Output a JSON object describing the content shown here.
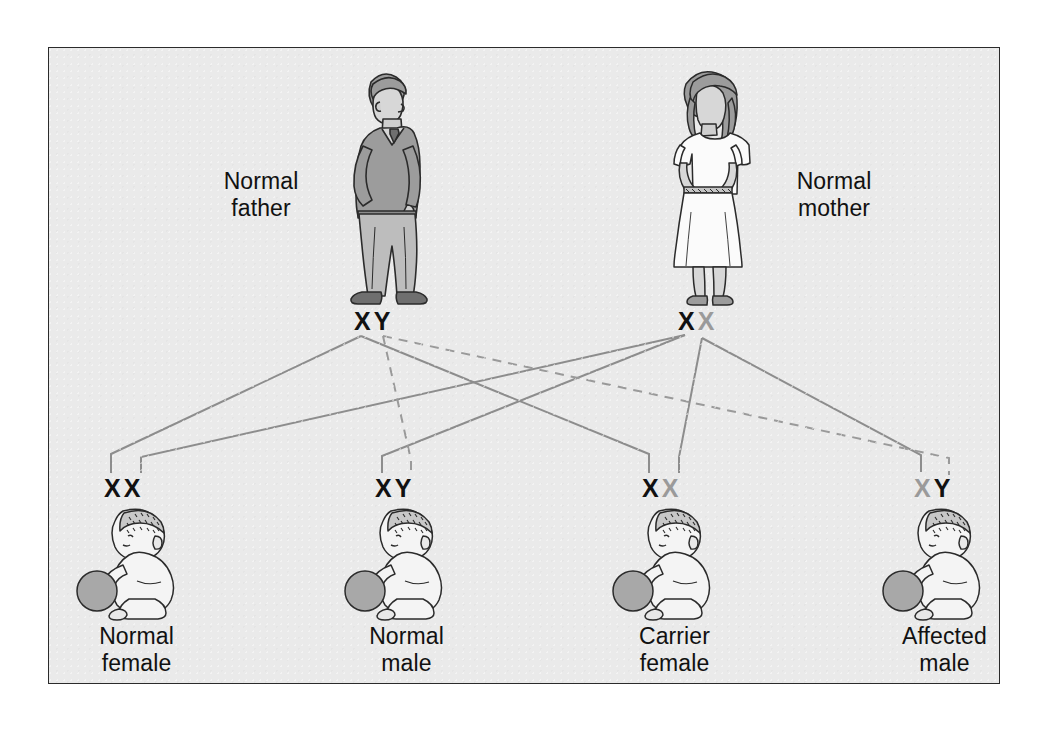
{
  "figure": {
    "type": "genetics-pedigree-punnett-diagram",
    "background_color": "#eaeaea",
    "border_color": "#2b2b2b",
    "page_color": "#ffffff"
  },
  "colors": {
    "normal_allele": "#111111",
    "mutant_allele": "#9a9a9a",
    "line_solid": "#8d8d8d",
    "line_dashed": "#9a9a9a",
    "figure_fill_mid": "#9c9c9c",
    "figure_fill_light": "#bdbdbd",
    "figure_fill_dark": "#6f6f6f",
    "outline": "#2b2b2b",
    "ball": "#a8a8a8"
  },
  "parents": [
    {
      "id": "father",
      "label": "Normal\nfather",
      "genotype": "XY",
      "alleles": [
        {
          "symbol": "X",
          "state": "normal"
        },
        {
          "symbol": "Y",
          "state": "normal"
        }
      ],
      "sex": "male"
    },
    {
      "id": "mother",
      "label": "Normal\nmother",
      "genotype": "XX",
      "alleles": [
        {
          "symbol": "X",
          "state": "normal"
        },
        {
          "symbol": "X",
          "state": "mutant"
        }
      ],
      "sex": "female",
      "carrier": true
    }
  ],
  "children": [
    {
      "id": "child-1",
      "label": "Normal\nfemale",
      "genotype": "XX",
      "alleles": [
        {
          "symbol": "X",
          "state": "normal"
        },
        {
          "symbol": "X",
          "state": "normal"
        }
      ],
      "status": "normal",
      "sex": "female"
    },
    {
      "id": "child-2",
      "label": "Normal\nmale",
      "genotype": "XY",
      "alleles": [
        {
          "symbol": "X",
          "state": "normal"
        },
        {
          "symbol": "Y",
          "state": "normal"
        }
      ],
      "status": "normal",
      "sex": "male"
    },
    {
      "id": "child-3",
      "label": "Carrier\nfemale",
      "genotype": "XX",
      "alleles": [
        {
          "symbol": "X",
          "state": "normal"
        },
        {
          "symbol": "X",
          "state": "mutant"
        }
      ],
      "status": "carrier",
      "sex": "female"
    },
    {
      "id": "child-4",
      "label": "Affected\nmale",
      "genotype": "XY",
      "alleles": [
        {
          "symbol": "X",
          "state": "mutant"
        },
        {
          "symbol": "Y",
          "state": "normal"
        }
      ],
      "status": "affected",
      "sex": "male"
    }
  ],
  "inheritance_lines": [
    {
      "from": "father.X",
      "to": "child-1.allele-1",
      "style": "solid"
    },
    {
      "from": "mother.X-normal",
      "to": "child-1.allele-2",
      "style": "solid"
    },
    {
      "from": "father.Y",
      "to": "child-2.allele-2",
      "style": "dashed"
    },
    {
      "from": "mother.X-normal",
      "to": "child-2.allele-1",
      "style": "solid"
    },
    {
      "from": "father.X",
      "to": "child-3.allele-1",
      "style": "solid"
    },
    {
      "from": "mother.X-mutant",
      "to": "child-3.allele-2",
      "style": "solid"
    },
    {
      "from": "father.Y",
      "to": "child-4.allele-2",
      "style": "dashed"
    },
    {
      "from": "mother.X-mutant",
      "to": "child-4.allele-1",
      "style": "solid"
    }
  ]
}
